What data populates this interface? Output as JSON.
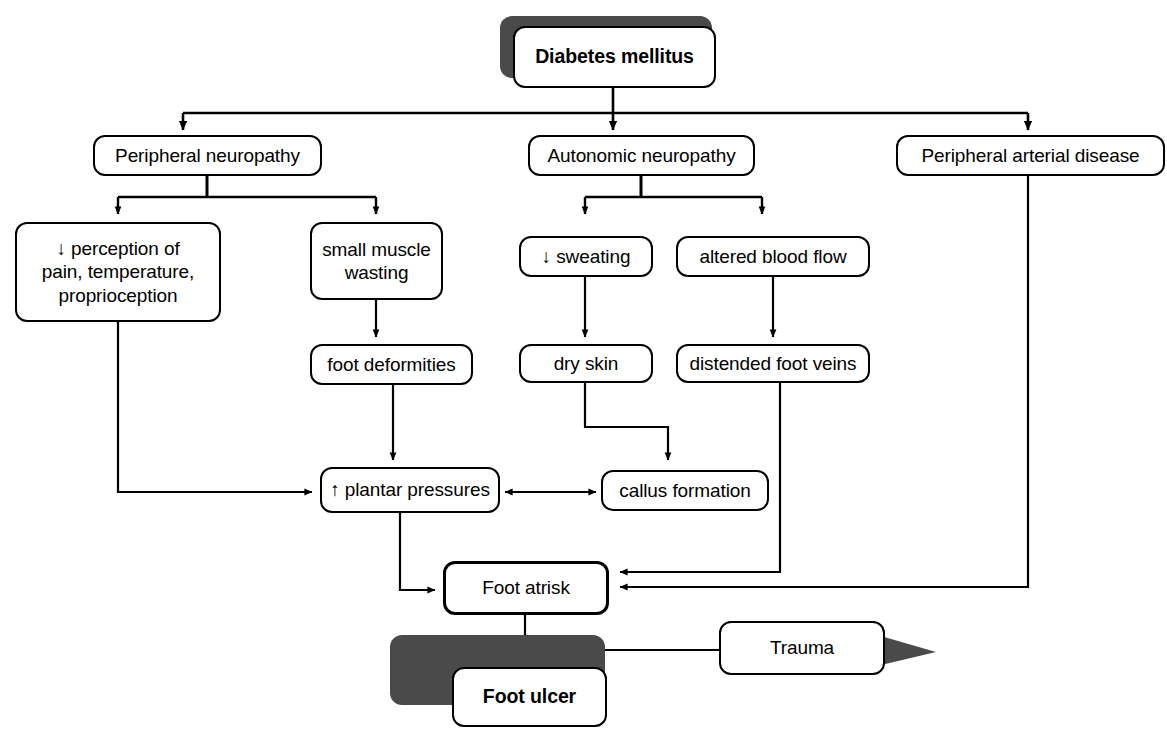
{
  "diagram": {
    "type": "flowchart",
    "background_color": "#ffffff",
    "line_color": "#000000",
    "shadow_color": "#4a4a4a"
  },
  "nodes": {
    "diabetes_mellitus": {
      "label": "Diabetes mellitus"
    },
    "peripheral_neuropathy": {
      "label": "Peripheral neuropathy"
    },
    "autonomic_neuropathy": {
      "label": "Autonomic neuropathy"
    },
    "peripheral_arterial_disease": {
      "label": "Peripheral arterial disease"
    },
    "reduced_perception": {
      "label": "↓ perception of\npain, temperature,\nproprioception"
    },
    "small_muscle_wasting": {
      "label": "small muscle\nwasting"
    },
    "reduced_sweating": {
      "label": "↓ sweating"
    },
    "altered_blood_flow": {
      "label": "altered blood flow"
    },
    "foot_deformities": {
      "label": "foot deformities"
    },
    "dry_skin": {
      "label": "dry skin"
    },
    "distended_foot_veins": {
      "label": "distended foot veins"
    },
    "increased_plantar_pressures": {
      "label": "↑ plantar pressures"
    },
    "callus_formation": {
      "label": "callus formation"
    },
    "foot_at_risk": {
      "label": "Foot atrisk"
    },
    "trauma": {
      "label": "Trauma"
    },
    "foot_ulcer": {
      "label": "Foot ulcer"
    }
  },
  "edges": [
    {
      "from": "diabetes_mellitus",
      "to": "peripheral_neuropathy",
      "style": "elbow"
    },
    {
      "from": "diabetes_mellitus",
      "to": "autonomic_neuropathy",
      "style": "straight"
    },
    {
      "from": "diabetes_mellitus",
      "to": "peripheral_arterial_disease",
      "style": "elbow"
    },
    {
      "from": "peripheral_neuropathy",
      "to": "reduced_perception",
      "style": "elbow"
    },
    {
      "from": "peripheral_neuropathy",
      "to": "small_muscle_wasting",
      "style": "elbow"
    },
    {
      "from": "autonomic_neuropathy",
      "to": "reduced_sweating",
      "style": "elbow"
    },
    {
      "from": "autonomic_neuropathy",
      "to": "altered_blood_flow",
      "style": "elbow"
    },
    {
      "from": "small_muscle_wasting",
      "to": "foot_deformities",
      "style": "straight"
    },
    {
      "from": "reduced_sweating",
      "to": "dry_skin",
      "style": "straight"
    },
    {
      "from": "altered_blood_flow",
      "to": "distended_foot_veins",
      "style": "straight"
    },
    {
      "from": "foot_deformities",
      "to": "increased_plantar_pressures",
      "style": "straight"
    },
    {
      "from": "reduced_perception",
      "to": "increased_plantar_pressures",
      "style": "elbow"
    },
    {
      "from": "dry_skin",
      "to": "callus_formation",
      "style": "elbow"
    },
    {
      "from": "increased_plantar_pressures",
      "to": "callus_formation",
      "style": "bidirectional"
    },
    {
      "from": "increased_plantar_pressures",
      "to": "foot_at_risk",
      "style": "elbow"
    },
    {
      "from": "distended_foot_veins",
      "to": "foot_at_risk",
      "style": "elbow"
    },
    {
      "from": "peripheral_arterial_disease",
      "to": "foot_at_risk",
      "style": "elbow"
    },
    {
      "from": "foot_at_risk",
      "to": "foot_ulcer",
      "style": "straight"
    },
    {
      "from": "trauma",
      "to": "foot_ulcer",
      "style": "straight"
    }
  ]
}
